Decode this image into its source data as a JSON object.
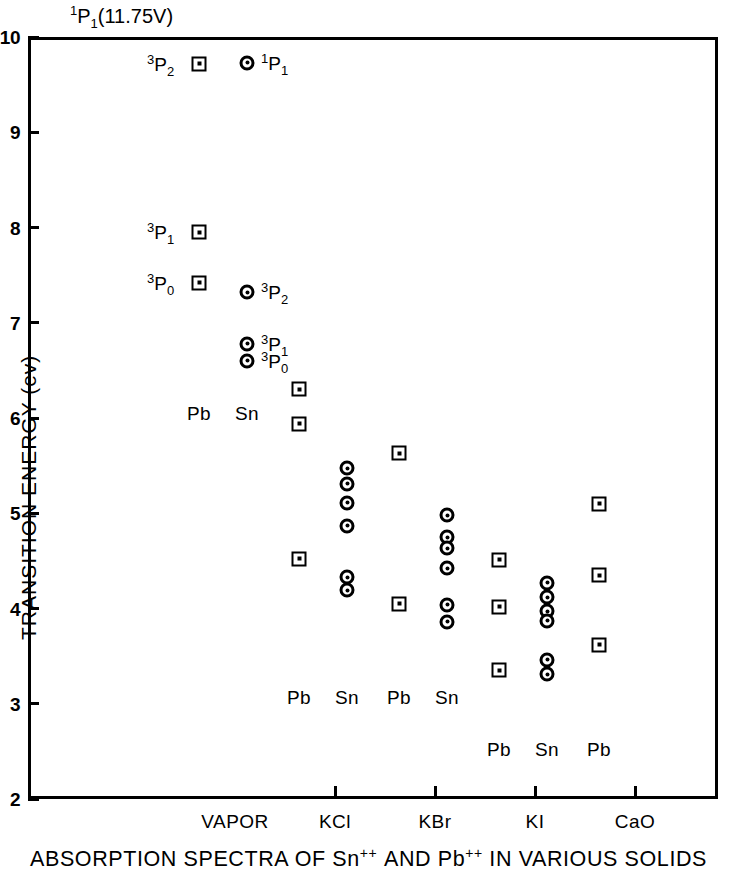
{
  "chart_data": {
    "type": "scatter",
    "caption_parts": {
      "p1": "ABSORPTION SPECTRA OF Sn",
      "sup1": "++",
      "p2": "AND Pb",
      "sup2": "++",
      "p3": "IN VARIOUS SOLIDS"
    },
    "xlabel": "",
    "ylabel": "TRANSITION ENERGY (ev)",
    "ylim": [
      2,
      10
    ],
    "yticks": [
      "2",
      "3",
      "4",
      "5",
      "6",
      "7",
      "8",
      "9",
      "10"
    ],
    "grid": false,
    "legend": "inline-column-labels",
    "categories": [
      "VAPOR",
      "KCl",
      "KBr",
      "KI",
      "CaO"
    ],
    "top_annotation": {
      "sup": "1",
      "base": "P",
      "sub": "1",
      "paren": "(11.75V)"
    },
    "series": [
      {
        "name": "Pb",
        "marker": "square",
        "points": [
          {
            "group": "VAPOR",
            "value": 9.72,
            "term": {
              "sup": "3",
              "base": "P",
              "sub": "2"
            },
            "term_side": "left"
          },
          {
            "group": "VAPOR",
            "value": 7.95,
            "term": {
              "sup": "3",
              "base": "P",
              "sub": "1"
            },
            "term_side": "left"
          },
          {
            "group": "VAPOR",
            "value": 7.42,
            "term": {
              "sup": "3",
              "base": "P",
              "sub": "0"
            },
            "term_side": "left"
          },
          {
            "group": "KCl",
            "value": 6.3
          },
          {
            "group": "KCl",
            "value": 5.94
          },
          {
            "group": "KCl",
            "value": 4.52
          },
          {
            "group": "KBr",
            "value": 5.63
          },
          {
            "group": "KBr",
            "value": 4.05
          },
          {
            "group": "KI",
            "value": 4.51
          },
          {
            "group": "KI",
            "value": 4.02
          },
          {
            "group": "KI",
            "value": 3.35
          },
          {
            "group": "CaO",
            "value": 5.1
          },
          {
            "group": "CaO",
            "value": 4.35
          },
          {
            "group": "CaO",
            "value": 3.62
          }
        ]
      },
      {
        "name": "Sn",
        "marker": "circle",
        "points": [
          {
            "group": "VAPOR",
            "value": 9.73,
            "term": {
              "sup": "1",
              "base": "P",
              "sub": "1"
            },
            "term_side": "right"
          },
          {
            "group": "VAPOR",
            "value": 7.32,
            "term": {
              "sup": "3",
              "base": "P",
              "sub": "2"
            },
            "term_side": "right"
          },
          {
            "group": "VAPOR",
            "value": 6.78,
            "term": {
              "sup": "3",
              "base": "P",
              "sub": "1"
            },
            "term_side": "right"
          },
          {
            "group": "VAPOR",
            "value": 6.6,
            "term": {
              "sup": "3",
              "base": "P",
              "sub": "0"
            },
            "term_side": "right"
          },
          {
            "group": "KCl",
            "value": 5.47
          },
          {
            "group": "KCl",
            "value": 5.31
          },
          {
            "group": "KCl",
            "value": 5.11
          },
          {
            "group": "KCl",
            "value": 4.87
          },
          {
            "group": "KCl",
            "value": 4.33
          },
          {
            "group": "KCl",
            "value": 4.19
          },
          {
            "group": "KBr",
            "value": 4.98
          },
          {
            "group": "KBr",
            "value": 4.75
          },
          {
            "group": "KBr",
            "value": 4.63
          },
          {
            "group": "KBr",
            "value": 4.42
          },
          {
            "group": "KBr",
            "value": 4.04
          },
          {
            "group": "KBr",
            "value": 3.86
          },
          {
            "group": "KI",
            "value": 4.27
          },
          {
            "group": "KI",
            "value": 4.12
          },
          {
            "group": "KI",
            "value": 3.97
          },
          {
            "group": "KI",
            "value": 3.87
          },
          {
            "group": "KI",
            "value": 3.46
          },
          {
            "group": "KI",
            "value": 3.31
          }
        ]
      }
    ],
    "column_labels": [
      {
        "text": "Pb",
        "group": "VAPOR",
        "series": "Pb",
        "value": 6.05
      },
      {
        "text": "Sn",
        "group": "VAPOR",
        "series": "Sn",
        "value": 6.05
      },
      {
        "text": "Pb",
        "group": "KCl",
        "series": "Pb",
        "value": 3.07
      },
      {
        "text": "Sn",
        "group": "KCl",
        "series": "Sn",
        "value": 3.07
      },
      {
        "text": "Pb",
        "group": "KBr",
        "series": "Pb",
        "value": 3.07
      },
      {
        "text": "Sn",
        "group": "KBr",
        "series": "Sn",
        "value": 3.07
      },
      {
        "text": "Pb",
        "group": "KI",
        "series": "Pb",
        "value": 2.52
      },
      {
        "text": "Sn",
        "group": "KI",
        "series": "Sn",
        "value": 2.52
      },
      {
        "text": "Pb",
        "group": "CaO",
        "series": "Pb",
        "value": 2.52
      }
    ]
  }
}
